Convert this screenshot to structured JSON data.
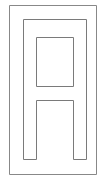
{
  "figure": {
    "title": "Letter A glyph outline",
    "background_color": "#ffffff",
    "width": 105,
    "height": 181,
    "stroke_color": "#7a7a7a",
    "frame_stroke_color": "#888888",
    "fill_color": "#ffffff",
    "stroke_width": 1,
    "shapes": {
      "frame": {
        "name": "outer-frame-rectangle",
        "x": 9.5,
        "y": 5.5,
        "width": 87,
        "height": 169
      },
      "glyph": {
        "name": "letter-a-outline",
        "description": "Rectangular arch with square counter and leg notch",
        "outer_left": 23.5,
        "outer_right": 86.5,
        "outer_top": 19.5,
        "leg_bottom": 159.5,
        "stem_width": 13,
        "path": "M 23.5 19.5 L 86.5 19.5 L 86.5 159.5 L 73.5 159.5 L 73.5 100.5 L 36.5 100.5 L 36.5 159.5 L 23.5 159.5 Z"
      },
      "counter": {
        "name": "counter-square",
        "x": 36.5,
        "y": 37.5,
        "width": 37,
        "height": 49
      }
    }
  }
}
